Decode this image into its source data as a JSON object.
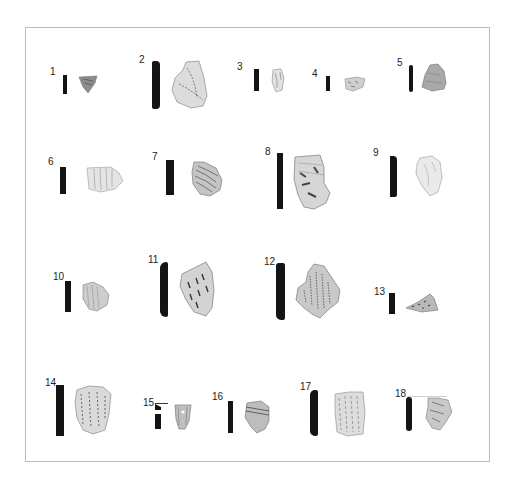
{
  "plate": {
    "frame_border_color": "#bdbdbd",
    "background": "#ffffff",
    "profile_color": "#141414",
    "items": [
      {
        "label": "1",
        "row": 1
      },
      {
        "label": "2",
        "row": 1
      },
      {
        "label": "3",
        "row": 1
      },
      {
        "label": "4",
        "row": 1
      },
      {
        "label": "5",
        "row": 1
      },
      {
        "label": "6",
        "row": 2
      },
      {
        "label": "7",
        "row": 2
      },
      {
        "label": "8",
        "row": 2
      },
      {
        "label": "9",
        "row": 2
      },
      {
        "label": "10",
        "row": 3
      },
      {
        "label": "11",
        "row": 3
      },
      {
        "label": "12",
        "row": 3
      },
      {
        "label": "13",
        "row": 3
      },
      {
        "label": "14",
        "row": 4
      },
      {
        "label": "15",
        "row": 4
      },
      {
        "label": "16",
        "row": 4
      },
      {
        "label": "17",
        "row": 4
      },
      {
        "label": "18",
        "row": 4
      }
    ]
  }
}
